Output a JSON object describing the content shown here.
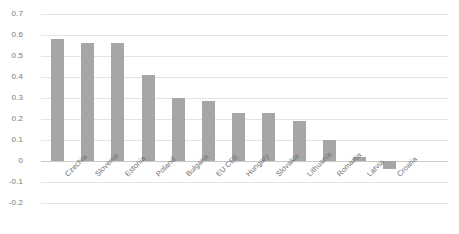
{
  "chart_data": {
    "type": "bar",
    "title": "",
    "subtitle": "",
    "xlabel": "",
    "ylabel": "",
    "ylim": [
      -0.2,
      0.7
    ],
    "grid": true,
    "legend": false,
    "bar_color": "#a6a6a6",
    "gridline_color": "#e4e4e4",
    "axis_text_color": "#7a7a7a",
    "ytick_labels": [
      "0.7",
      "0.6",
      "0.5",
      "0.4",
      "0.3",
      "0.2",
      "0.1",
      "0",
      "-0.1",
      "-0.2"
    ],
    "ytick_values": [
      0.7,
      0.6,
      0.5,
      0.4,
      0.3,
      0.2,
      0.1,
      0,
      -0.1,
      -0.2
    ],
    "categories": [
      "Czechia",
      "Slovenia",
      "Estonia",
      "Poland",
      "Bulgaria",
      "EU CEE",
      "Hungary",
      "Slovakia",
      "Lithuania",
      "Romania",
      "Latvia",
      "Croatia"
    ],
    "values": [
      0.58,
      0.56,
      0.56,
      0.41,
      0.3,
      0.285,
      0.23,
      0.23,
      0.19,
      0.1,
      0.02,
      -0.04
    ]
  }
}
